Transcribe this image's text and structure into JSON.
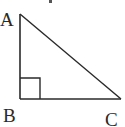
{
  "diagram": {
    "type": "right-triangle",
    "stroke_color": "#2a2a2a",
    "vertices": {
      "A": {
        "label": "A",
        "x": 20,
        "y": 14
      },
      "B": {
        "label": "B",
        "x": 20,
        "y": 99
      },
      "C": {
        "label": "C",
        "x": 121,
        "y": 99
      }
    },
    "right_angle_at": "B",
    "labels": {
      "a": "A",
      "b": "B",
      "c": "C"
    }
  }
}
